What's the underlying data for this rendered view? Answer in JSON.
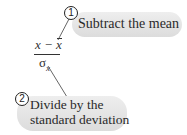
{
  "annotations": [
    {
      "number": "1",
      "label": "Subtract the mean"
    },
    {
      "number": "2",
      "label_line1": "Divide by the",
      "label_line2": "standard deviation"
    }
  ],
  "formula": {
    "numerator_x": "x",
    "numerator_op": " − ",
    "numerator_mean": "x",
    "denominator_symbol": "σ",
    "denominator_subscript": "x"
  }
}
